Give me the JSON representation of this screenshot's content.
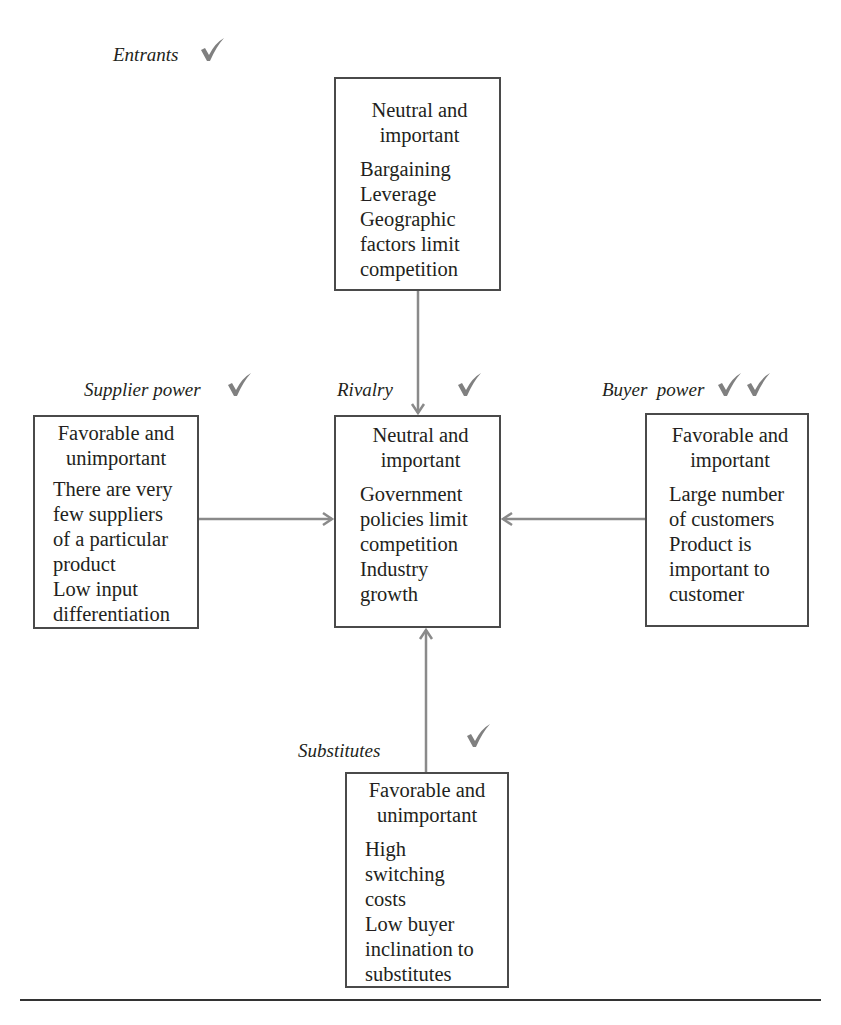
{
  "diagram": {
    "type": "five-forces",
    "accent_color": "#808080",
    "box_border_color": "#4a4a4a",
    "arrow_color": "#8a8a8a",
    "forces": {
      "entrants": {
        "label": "Entrants",
        "checks": 1,
        "rating_lines": [
          "Neutral and",
          "important"
        ],
        "factor_lines": [
          "Bargaining",
          "Leverage",
          "Geographic",
          "factors limit",
          "competition"
        ]
      },
      "supplier_power": {
        "label": "Supplier power",
        "checks": 1,
        "rating_lines": [
          "Favorable and",
          "unimportant"
        ],
        "factor_lines": [
          "There are very",
          "few suppliers",
          "of a particular",
          "product",
          "Low input",
          "differentiation"
        ]
      },
      "rivalry": {
        "label": "Rivalry",
        "checks": 1,
        "rating_lines": [
          "Neutral and",
          "important"
        ],
        "factor_lines": [
          "Government",
          "policies limit",
          "competition",
          "Industry",
          "growth"
        ]
      },
      "buyer_power": {
        "label": "Buyer  power",
        "checks": 2,
        "rating_lines": [
          "Favorable and",
          "important"
        ],
        "factor_lines": [
          "Large number",
          "of customers",
          "Product is",
          "important to",
          "customer"
        ]
      },
      "substitutes": {
        "label": "Substitutes",
        "checks": 1,
        "rating_lines": [
          "Favorable and",
          "unimportant"
        ],
        "factor_lines": [
          "High",
          "switching",
          "costs",
          "Low buyer",
          "inclination to",
          "substitutes"
        ]
      }
    },
    "arrows": [
      {
        "from": "entrants",
        "to": "rivalry",
        "direction": "down"
      },
      {
        "from": "supplier_power",
        "to": "rivalry",
        "direction": "right"
      },
      {
        "from": "buyer_power",
        "to": "rivalry",
        "direction": "left"
      },
      {
        "from": "substitutes",
        "to": "rivalry",
        "direction": "up"
      }
    ]
  }
}
